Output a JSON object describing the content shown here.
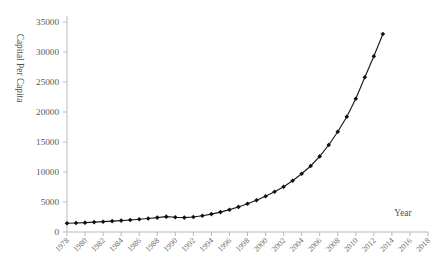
{
  "chart_data": {
    "type": "line",
    "title": "",
    "subtitle": "",
    "xlabel": "Year",
    "ylabel": "Capital Per Capita",
    "xlim": [
      1978,
      2018
    ],
    "ylim": [
      0,
      35000
    ],
    "grid": false,
    "legend": false,
    "legend_position": "none",
    "marker": "filled-diamond",
    "line_color": "#111111",
    "marker_color": "#111111",
    "ytick_labels": [
      "0",
      "5000",
      "10000",
      "15000",
      "20000",
      "25000",
      "30000",
      "35000"
    ],
    "ytick_values": [
      0,
      5000,
      10000,
      15000,
      20000,
      25000,
      30000,
      35000
    ],
    "xtick_labels": [
      "1978",
      "1980",
      "1982",
      "1984",
      "1986",
      "1988",
      "1990",
      "1992",
      "1994",
      "1996",
      "1998",
      "2000",
      "2002",
      "2004",
      "2006",
      "2008",
      "2010",
      "2012",
      "2014",
      "2016",
      "2018"
    ],
    "xtick_values": [
      1978,
      1980,
      1982,
      1984,
      1986,
      1988,
      1990,
      1992,
      1994,
      1996,
      1998,
      2000,
      2002,
      2004,
      2006,
      2008,
      2010,
      2012,
      2014,
      2016,
      2018
    ],
    "x": [
      1978,
      1979,
      1980,
      1981,
      1982,
      1983,
      1984,
      1985,
      1986,
      1987,
      1988,
      1989,
      1990,
      1991,
      1992,
      1993,
      1994,
      1995,
      1996,
      1997,
      1998,
      1999,
      2000,
      2001,
      2002,
      2003,
      2004,
      2005,
      2006,
      2007,
      2008,
      2009,
      2010,
      2011,
      2012,
      2013
    ],
    "values": [
      1450,
      1500,
      1560,
      1640,
      1720,
      1810,
      1900,
      2000,
      2120,
      2250,
      2400,
      2560,
      2450,
      2400,
      2500,
      2700,
      2980,
      3320,
      3720,
      4180,
      4700,
      5280,
      5950,
      6700,
      7550,
      8550,
      9700,
      11000,
      12600,
      14500,
      16700,
      19200,
      22200,
      25800,
      29300,
      33000
    ],
    "series": [
      {
        "name": "Capital Per Capita",
        "values": [
          1450,
          1500,
          1560,
          1640,
          1720,
          1810,
          1900,
          2000,
          2120,
          2250,
          2400,
          2560,
          2450,
          2400,
          2500,
          2700,
          2980,
          3320,
          3720,
          4180,
          4700,
          5280,
          5950,
          6700,
          7550,
          8550,
          9700,
          11000,
          12600,
          14500,
          16700,
          19200,
          22200,
          25800,
          29300,
          33000
        ]
      }
    ]
  },
  "figure": {
    "y_axis_title": "Capital Per Capita",
    "x_axis_title": "Year"
  }
}
